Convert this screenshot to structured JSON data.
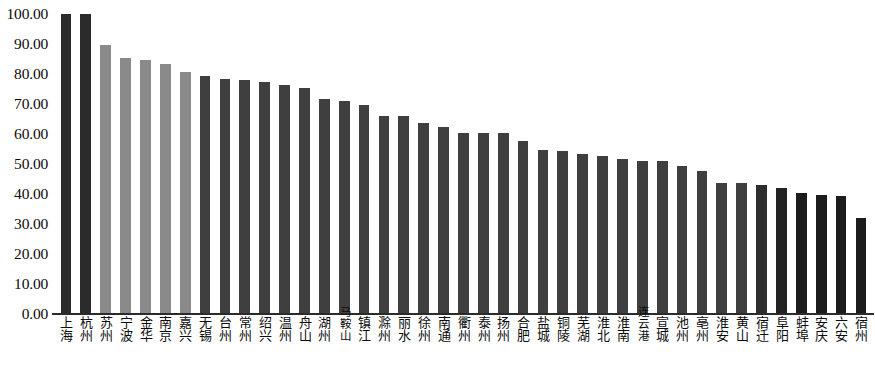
{
  "chart_data": {
    "type": "bar",
    "title": "",
    "subtitle": "",
    "xlabel": "",
    "ylabel": "",
    "grid": false,
    "legend": "none",
    "ylim": [
      0,
      100
    ],
    "ytick_labels": [
      "100.00",
      "90.00",
      "80.00",
      "70.00",
      "60.00",
      "50.00",
      "40.00",
      "30.00",
      "20.00",
      "10.00",
      "0.00"
    ],
    "ytick_values": [
      100,
      90,
      80,
      70,
      60,
      50,
      40,
      30,
      20,
      10,
      0
    ],
    "categories": [
      "上海",
      "杭州",
      "苏州",
      "宁波",
      "金华",
      "南京",
      "嘉兴",
      "无锡",
      "台州",
      "常州",
      "绍兴",
      "温州",
      "舟山",
      "湖州",
      "马鞍山",
      "镇江",
      "滁州",
      "丽水",
      "徐州",
      "南通",
      "衢州",
      "泰州",
      "扬州",
      "合肥",
      "盐城",
      "铜陵",
      "芜湖",
      "淮北",
      "淮南",
      "连云港",
      "宣城",
      "池州",
      "亳州",
      "淮安",
      "黄山",
      "宿迁",
      "阜阳",
      "蚌埠",
      "安庆",
      "六安",
      "宿州"
    ],
    "values": [
      100.0,
      100.0,
      89.6,
      85.2,
      84.8,
      83.4,
      80.7,
      79.3,
      78.4,
      77.9,
      77.2,
      76.5,
      75.2,
      71.8,
      71.0,
      69.7,
      66.0,
      65.9,
      63.6,
      62.2,
      60.4,
      60.4,
      60.2,
      57.7,
      54.6,
      54.2,
      53.2,
      52.8,
      51.8,
      51.0,
      51.0,
      49.2,
      47.6,
      43.8,
      43.7,
      42.9,
      42.1,
      40.4,
      39.6,
      39.3,
      32.0
    ],
    "bar_colors": [
      "#2b2b2b",
      "#2b2b2b",
      "#8a8a8a",
      "#8a8a8a",
      "#8a8a8a",
      "#8a8a8a",
      "#8a8a8a",
      "#3f3f3f",
      "#3f3f3f",
      "#3f3f3f",
      "#3f3f3f",
      "#3f3f3f",
      "#3f3f3f",
      "#3f3f3f",
      "#3f3f3f",
      "#3f3f3f",
      "#3f3f3f",
      "#3f3f3f",
      "#3f3f3f",
      "#3f3f3f",
      "#3f3f3f",
      "#3f3f3f",
      "#3f3f3f",
      "#3f3f3f",
      "#3f3f3f",
      "#3f3f3f",
      "#3f3f3f",
      "#3f3f3f",
      "#3f3f3f",
      "#3f3f3f",
      "#3f3f3f",
      "#3f3f3f",
      "#3f3f3f",
      "#3f3f3f",
      "#3f3f3f",
      "#2e2e2e",
      "#232323",
      "#1c1c1c",
      "#1c1c1c",
      "#1c1c1c",
      "#1c1c1c"
    ]
  },
  "axis": {
    "baseline_color": "#2b2b2b",
    "tick_text_color": "#0b0b0b"
  }
}
